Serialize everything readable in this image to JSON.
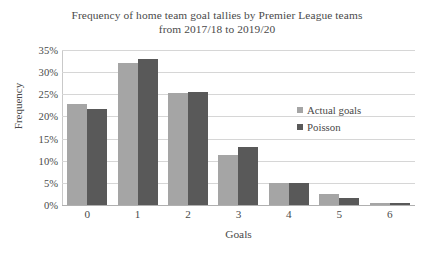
{
  "chart_data": {
    "type": "bar",
    "title": "Frequency of home team goal tallies by Premier League teams from 2017/18 to 2019/20",
    "title_line1": "Frequency of home team goal tallies by Premier League teams",
    "title_line2": "from 2017/18 to 2019/20",
    "xlabel": "Goals",
    "ylabel": "Frequency",
    "categories": [
      "0",
      "1",
      "2",
      "3",
      "4",
      "5",
      "6"
    ],
    "series": [
      {
        "name": "Actual goals",
        "color": "#a5a5a5",
        "values": [
          22.8,
          32.0,
          25.2,
          11.2,
          5.0,
          2.4,
          0.4
        ]
      },
      {
        "name": "Poisson",
        "color": "#595959",
        "values": [
          21.7,
          33.0,
          25.5,
          13.0,
          5.0,
          1.5,
          0.4
        ]
      }
    ],
    "ylim": [
      0,
      35
    ],
    "ytick_values": [
      35,
      30,
      25,
      20,
      15,
      10,
      5,
      0
    ],
    "ytick_labels": [
      "35%",
      "30%",
      "25%",
      "20%",
      "15%",
      "10%",
      "5%",
      "0%"
    ],
    "grid": true,
    "legend_position": "inside-right"
  }
}
